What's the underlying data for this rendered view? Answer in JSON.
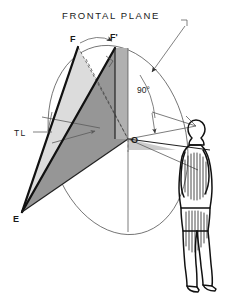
{
  "diagram": {
    "title": "FRONTAL PLANE",
    "type": "descriptive-geometry-revolution",
    "background_color": "#ffffff",
    "ink_color": "#111111",
    "labels": {
      "frontal_plane": "FRONTAL PLANE",
      "point_f": "F",
      "point_f_prime": "F'",
      "point_o": "O",
      "point_e": "E",
      "true_length": "TL",
      "angle": "90°"
    },
    "annotations": [
      {
        "id": "frontal-plane",
        "text": "FRONTAL PLANE",
        "role": "plane-callout"
      },
      {
        "id": "point-f",
        "text": "F",
        "role": "vertex-label"
      },
      {
        "id": "point-f-prime",
        "text": "F'",
        "role": "revolved-vertex-label"
      },
      {
        "id": "point-o",
        "text": "O",
        "role": "center-of-rotation-label"
      },
      {
        "id": "point-e",
        "text": "E",
        "role": "apex-label"
      },
      {
        "id": "true-length",
        "text": "TL",
        "role": "true-length-callout"
      },
      {
        "id": "right-angle",
        "text": "90°",
        "role": "angle-callout"
      }
    ],
    "surfaces": [
      {
        "id": "triangle-efo-light",
        "fill": "#dcdcdc",
        "label": "triangle E-F-O"
      },
      {
        "id": "triangle-efo-dark",
        "fill": "#969696",
        "label": "triangle E-F'-O"
      },
      {
        "id": "triangle-oright-mid",
        "fill": "#b4b4b4",
        "label": "frontal strip"
      }
    ],
    "figure": {
      "name": "observer",
      "description": "standing human figure in profile, hatched shading"
    }
  }
}
